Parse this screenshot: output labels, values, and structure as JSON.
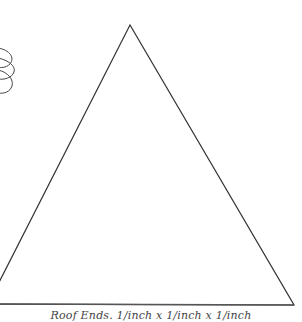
{
  "diagram": {
    "caption": "Roof Ends. 1/inch x 1/inch x 1/inch",
    "stroke_color": "#333333",
    "triangle": {
      "apex": [
        130,
        25
      ],
      "left_base": [
        -12,
        304
      ],
      "right_base": [
        294,
        305
      ]
    },
    "coil_shape": {
      "description": "partial stacked coil/cloud shape at left edge"
    }
  }
}
